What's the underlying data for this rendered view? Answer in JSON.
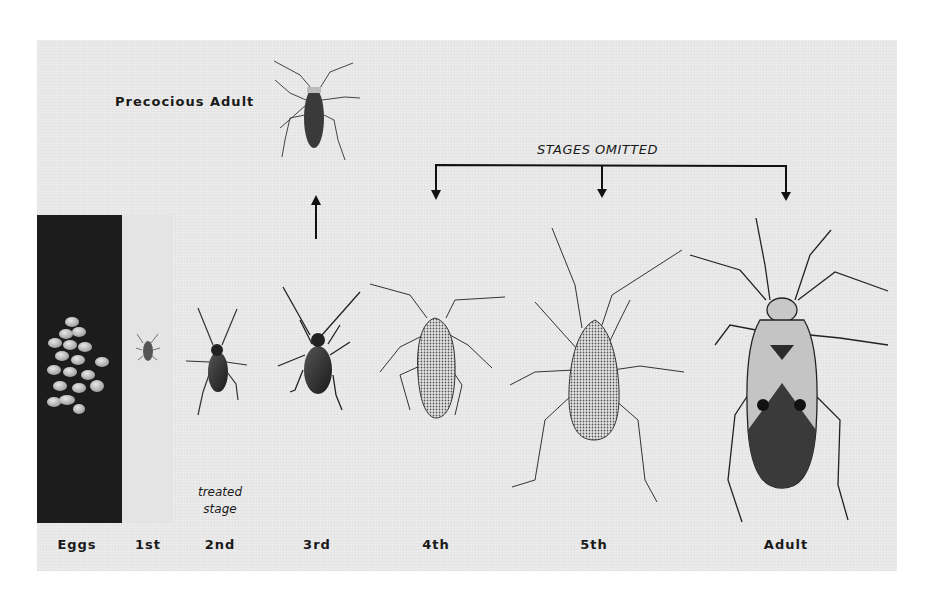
{
  "figure": {
    "labels": {
      "precocious_adult": "Precocious Adult",
      "stages_omitted": "STAGES OMITTED",
      "treated_stage_line1": "treated",
      "treated_stage_line2": "stage"
    },
    "stages": [
      {
        "label": "Eggs",
        "x": 77
      },
      {
        "label": "1st",
        "x": 148
      },
      {
        "label": "2nd",
        "x": 220
      },
      {
        "label": "3rd",
        "x": 317
      },
      {
        "label": "4th",
        "x": 436
      },
      {
        "label": "5th",
        "x": 594
      },
      {
        "label": "Adult",
        "x": 786
      }
    ],
    "colors": {
      "panel_bg": "#ebebeb",
      "eggs_bg": "#1c1c1c",
      "ink": "#1a1a1a"
    }
  }
}
